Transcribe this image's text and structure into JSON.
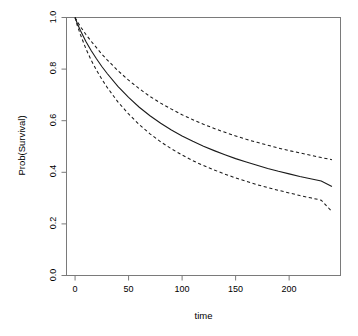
{
  "chart_data": {
    "type": "line",
    "title": "",
    "xlabel": "time",
    "ylabel": "Prob(Survival)",
    "xlim": [
      -8,
      248
    ],
    "ylim": [
      0.0,
      1.0
    ],
    "grid": false,
    "legend": "none",
    "xticks": [
      0,
      50,
      100,
      150,
      200
    ],
    "xtick_labels": [
      "0",
      "50",
      "100",
      "150",
      "200"
    ],
    "yticks": [
      0.0,
      0.2,
      0.4,
      0.6,
      0.8,
      1.0
    ],
    "ytick_labels": [
      "0.0",
      "0.2",
      "0.4",
      "0.6",
      "0.8",
      "1.0"
    ],
    "x": [
      0,
      2,
      5,
      10,
      15,
      20,
      25,
      30,
      40,
      50,
      60,
      70,
      80,
      90,
      100,
      110,
      120,
      130,
      140,
      150,
      160,
      170,
      180,
      190,
      200,
      210,
      220,
      230,
      240
    ],
    "series": [
      {
        "name": "upper-confidence-band",
        "style": "dashed",
        "color": "#1a1a1a",
        "values": [
          1.0,
          0.985,
          0.965,
          0.935,
          0.908,
          0.883,
          0.858,
          0.836,
          0.794,
          0.757,
          0.724,
          0.694,
          0.668,
          0.645,
          0.623,
          0.604,
          0.586,
          0.57,
          0.555,
          0.541,
          0.528,
          0.516,
          0.505,
          0.494,
          0.484,
          0.475,
          0.466,
          0.457,
          0.449
        ]
      },
      {
        "name": "survival-estimate",
        "style": "solid",
        "color": "#1a1a1a",
        "values": [
          1.0,
          0.978,
          0.95,
          0.908,
          0.872,
          0.84,
          0.81,
          0.783,
          0.733,
          0.69,
          0.652,
          0.619,
          0.59,
          0.564,
          0.541,
          0.52,
          0.501,
          0.484,
          0.468,
          0.453,
          0.44,
          0.427,
          0.415,
          0.404,
          0.394,
          0.384,
          0.375,
          0.366,
          0.345
        ]
      },
      {
        "name": "lower-confidence-band",
        "style": "dashed",
        "color": "#1a1a1a",
        "values": [
          1.0,
          0.97,
          0.934,
          0.88,
          0.835,
          0.796,
          0.761,
          0.729,
          0.673,
          0.626,
          0.585,
          0.549,
          0.518,
          0.491,
          0.467,
          0.445,
          0.426,
          0.409,
          0.393,
          0.378,
          0.365,
          0.352,
          0.341,
          0.33,
          0.32,
          0.31,
          0.301,
          0.292,
          0.248
        ]
      }
    ]
  }
}
